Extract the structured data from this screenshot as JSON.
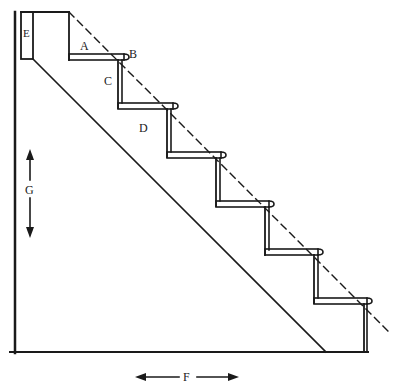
{
  "diagram": {
    "type": "staircase-cross-section",
    "step_count": 6,
    "labels": {
      "A": "A",
      "B": "B",
      "C": "C",
      "D": "D",
      "E": "E",
      "F": "F",
      "G": "G"
    },
    "label_meanings_visual": {
      "A": "tread",
      "B": "nosing",
      "C": "riser",
      "D": "stringer",
      "E": "header / top post",
      "F": "horizontal run (arrow)",
      "G": "vertical rise (arrow)"
    },
    "colors": {
      "stroke": "#1a1a1a",
      "background": "#ffffff"
    }
  }
}
